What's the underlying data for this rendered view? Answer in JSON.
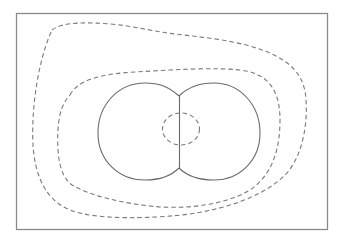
{
  "diagram": {
    "type": "contour-diagram",
    "frame": {
      "x": 16,
      "y": 13,
      "width": 311,
      "height": 216
    },
    "colors": {
      "frame": "#8a8a8a",
      "solid_line": "#6a6a6a",
      "dashed_line": "#7a7a7a",
      "background": "#ffffff"
    },
    "elements": [
      {
        "name": "left-lobe",
        "style": "solid"
      },
      {
        "name": "right-lobe",
        "style": "solid"
      },
      {
        "name": "center-divider",
        "style": "solid"
      },
      {
        "name": "inner-dashed-contour",
        "style": "dashed"
      },
      {
        "name": "middle-dashed-contour",
        "style": "dashed"
      },
      {
        "name": "outer-dashed-contour",
        "style": "dashed"
      }
    ]
  }
}
